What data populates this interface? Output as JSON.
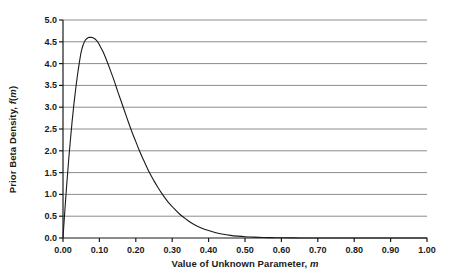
{
  "chart_data": {
    "type": "line",
    "title": "",
    "xlabel": "Value of Unknown Parameter, m",
    "ylabel": "Prior Beta Density, f(m)",
    "xlabel_prefix": "Value of Unknown Parameter, ",
    "xlabel_italic": "m",
    "ylabel_prefix": "Prior Beta Density, ",
    "ylabel_italic_f": "f",
    "ylabel_italic_m": "m",
    "xlim": [
      0.0,
      1.0
    ],
    "ylim": [
      0.0,
      5.0
    ],
    "xticks": [
      "0.00",
      "0.10",
      "0.20",
      "0.30",
      "0.40",
      "0.50",
      "0.60",
      "0.70",
      "0.80",
      "0.90",
      "1.00"
    ],
    "xtick_values": [
      0.0,
      0.1,
      0.2,
      0.3,
      0.4,
      0.5,
      0.6,
      0.7,
      0.8,
      0.9,
      1.0
    ],
    "yticks": [
      "0.0",
      "0.5",
      "1.0",
      "1.5",
      "2.0",
      "2.5",
      "3.0",
      "3.5",
      "4.0",
      "4.5",
      "5.0"
    ],
    "ytick_values": [
      0.0,
      0.5,
      1.0,
      1.5,
      2.0,
      2.5,
      3.0,
      3.5,
      4.0,
      4.5,
      5.0
    ],
    "grid": "horizontal",
    "legend": "none",
    "series": [
      {
        "name": "Prior Beta Density",
        "color": "#1a1a1a",
        "x": [
          0.0,
          0.005,
          0.01,
          0.015,
          0.02,
          0.025,
          0.03,
          0.035,
          0.04,
          0.045,
          0.05,
          0.055,
          0.06,
          0.065,
          0.07,
          0.075,
          0.08,
          0.085,
          0.09,
          0.095,
          0.1,
          0.11,
          0.12,
          0.13,
          0.14,
          0.15,
          0.16,
          0.17,
          0.18,
          0.19,
          0.2,
          0.21,
          0.22,
          0.23,
          0.24,
          0.25,
          0.26,
          0.27,
          0.28,
          0.29,
          0.3,
          0.32,
          0.34,
          0.36,
          0.38,
          0.4,
          0.42,
          0.44,
          0.46,
          0.48,
          0.5,
          0.525,
          0.55,
          0.575,
          0.6,
          0.65,
          0.7,
          0.75,
          0.8,
          0.85,
          0.9,
          0.95,
          1.0
        ],
        "y": [
          0.0,
          0.62,
          1.2,
          1.73,
          2.22,
          2.67,
          3.07,
          3.43,
          3.75,
          4.03,
          4.27,
          4.42,
          4.52,
          4.57,
          4.6,
          4.6,
          4.6,
          4.58,
          4.55,
          4.5,
          4.43,
          4.27,
          4.07,
          3.85,
          3.62,
          3.37,
          3.13,
          2.89,
          2.65,
          2.42,
          2.21,
          2.0,
          1.81,
          1.63,
          1.46,
          1.31,
          1.17,
          1.04,
          0.92,
          0.81,
          0.72,
          0.55,
          0.42,
          0.31,
          0.23,
          0.17,
          0.12,
          0.085,
          0.06,
          0.042,
          0.029,
          0.019,
          0.012,
          0.0075,
          0.0046,
          0.0016,
          0.0005,
          0.00015,
          4e-05,
          1e-05,
          2e-06,
          2e-07,
          0.0
        ],
        "peak": {
          "x": 0.075,
          "y": 4.6
        }
      }
    ],
    "colors": {
      "grid": "#8c8c8c",
      "axis": "#1a1a1a",
      "curve": "#1a1a1a",
      "background": "#ffffff",
      "text": "#1a1a1a"
    },
    "plot_area": {
      "left": 63,
      "top": 20,
      "right": 427,
      "bottom": 238
    }
  }
}
